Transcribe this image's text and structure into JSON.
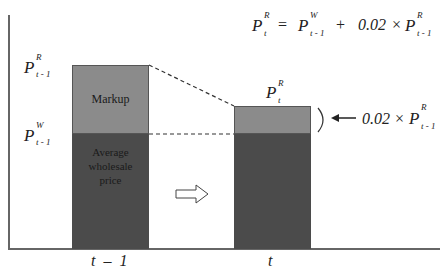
{
  "formula": {
    "lhs_symbol": "P",
    "lhs_sup": "R",
    "lhs_sub": "t",
    "equals": "=",
    "term1_symbol": "P",
    "term1_sup": "W",
    "term1_sub": "t - 1",
    "plus": "+",
    "coef": "0.02",
    "times": "×",
    "term2_symbol": "P",
    "term2_sup": "R",
    "term2_sub": "t - 1"
  },
  "left_labels": {
    "retail": {
      "symbol": "P",
      "sup": "R",
      "sub": "t - 1"
    },
    "wholesale": {
      "symbol": "P",
      "sup": "W",
      "sub": "t - 1"
    }
  },
  "bar1": {
    "markup_label": "Markup",
    "wholesale_label_lines": [
      "Average",
      "wholesale",
      "price"
    ]
  },
  "bar2": {
    "top_label": {
      "symbol": "P",
      "sup": "R",
      "sub": "t"
    }
  },
  "annotation": {
    "arrow": "←",
    "coef": "0.02",
    "times": "×",
    "symbol": "P",
    "sup": "R",
    "sub": "t - 1"
  },
  "x_axis": {
    "labels": [
      "t  –  1",
      "t"
    ]
  },
  "colors": {
    "markup": "#8b8b8b",
    "wholesale": "#4b4b4b",
    "axis": "#666666"
  }
}
